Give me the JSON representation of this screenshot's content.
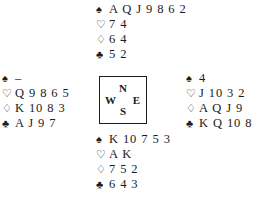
{
  "diagram": {
    "type": "bridge-deal-diagram",
    "background_color": "#ffffff",
    "ink_color": "#1c1c1c"
  },
  "suits": {
    "spade": {
      "name": "spade-suit-symbol",
      "glyph": "♠",
      "filled": true
    },
    "heart": {
      "name": "heart-suit-symbol",
      "glyph": "♡",
      "filled": false
    },
    "diamond": {
      "name": "diamond-suit-symbol",
      "glyph": "♢",
      "filled": false
    },
    "club": {
      "name": "club-suit-symbol",
      "glyph": "♣",
      "filled": true
    }
  },
  "compass": {
    "north_label": "N",
    "south_label": "S",
    "west_label": "W",
    "east_label": "E"
  },
  "hands": {
    "north": {
      "position": "North",
      "spades": "A Q J 9 8 6 2",
      "hearts": "7 4",
      "diamonds": "6 4",
      "clubs": "5 2"
    },
    "west": {
      "position": "West",
      "spades": "–",
      "hearts": "Q 9 8 6 5",
      "diamonds": "K 10 8 3",
      "clubs": "A J 9 7"
    },
    "east": {
      "position": "East",
      "spades": "4",
      "hearts": "J 10 3 2",
      "diamonds": "A Q J 9",
      "clubs": "K Q 10 8"
    },
    "south": {
      "position": "South",
      "spades": "K 10 7 5 3",
      "hearts": "A K",
      "diamonds": "7 5 2",
      "clubs": "6 4 3"
    }
  }
}
